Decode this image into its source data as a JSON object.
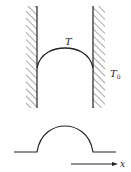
{
  "diagram": {
    "labels": {
      "meniscus_temperature": "T",
      "wall_temperature": "T",
      "wall_temperature_subscript": "0",
      "axis": "x"
    },
    "colors": {
      "stroke": "#222222",
      "hatch": "#555555",
      "background": "#ffffff"
    }
  }
}
